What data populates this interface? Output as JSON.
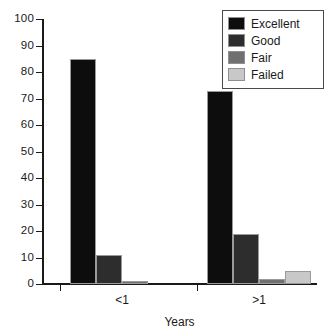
{
  "chart_data": {
    "type": "bar",
    "title": "",
    "subtitle": "",
    "xlabel": "Years",
    "ylabel": "",
    "categories": [
      "<1",
      ">1"
    ],
    "series": [
      {
        "name": "Excellent",
        "color": "#0d0d0d",
        "values": [
          85,
          73
        ]
      },
      {
        "name": "Good",
        "color": "#2d2d2d",
        "values": [
          11,
          19
        ]
      },
      {
        "name": "Fair",
        "color": "#707070",
        "values": [
          1,
          2
        ]
      },
      {
        "name": "Failed",
        "color": "#c8c8c8",
        "values": [
          0,
          5
        ]
      }
    ],
    "ylim": [
      0,
      100
    ],
    "ytick_step": 10,
    "yticks": [
      0,
      10,
      20,
      30,
      40,
      50,
      60,
      70,
      80,
      90,
      100
    ],
    "ytick_labels": [
      "0",
      "10",
      "20",
      "30",
      "40",
      "50",
      "60",
      "70",
      "80",
      "90",
      "100"
    ],
    "grid": false,
    "legend_position": "top-right",
    "legend_entries": [
      "Excellent",
      "Good",
      "Fair",
      "Failed"
    ],
    "background_color": "#ffffff",
    "axis_color": "#1a1a1a",
    "bar_edge_color": "#9a9a9a",
    "grouped": true
  }
}
